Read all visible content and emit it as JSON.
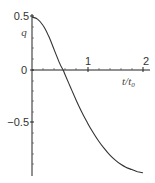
{
  "chart_data": {
    "type": "line",
    "title": "",
    "xlabel": "t/t₀",
    "ylabel": "q",
    "xlim": [
      0,
      2
    ],
    "ylim": [
      -1.0,
      0.5
    ],
    "grid": false,
    "legend": null,
    "x_ticks": [
      "1",
      "2"
    ],
    "y_ticks": [
      "0.5",
      "0",
      "−0.5"
    ],
    "series": [
      {
        "name": "q",
        "x": [
          0.0,
          0.1,
          0.2,
          0.3,
          0.4,
          0.5,
          0.56,
          0.6,
          0.7,
          0.8,
          0.9,
          1.0,
          1.1,
          1.2,
          1.3,
          1.4,
          1.5,
          1.6,
          1.7,
          1.8,
          1.9,
          2.0
        ],
        "values": [
          0.5,
          0.48,
          0.42,
          0.32,
          0.19,
          0.06,
          0.0,
          -0.05,
          -0.17,
          -0.29,
          -0.4,
          -0.5,
          -0.59,
          -0.67,
          -0.74,
          -0.8,
          -0.85,
          -0.89,
          -0.92,
          -0.94,
          -0.96,
          -0.97
        ]
      }
    ]
  },
  "labels": {
    "y_tick_top": "0.5",
    "y_tick_zero": "0",
    "y_tick_bottom": "−0.5",
    "x_tick_1": "1",
    "x_tick_2": "2",
    "y_axis_label": "q",
    "x_axis_label_t": "t",
    "x_axis_label_slash": "/",
    "x_axis_label_t0": "t",
    "x_axis_label_sub": "0"
  }
}
